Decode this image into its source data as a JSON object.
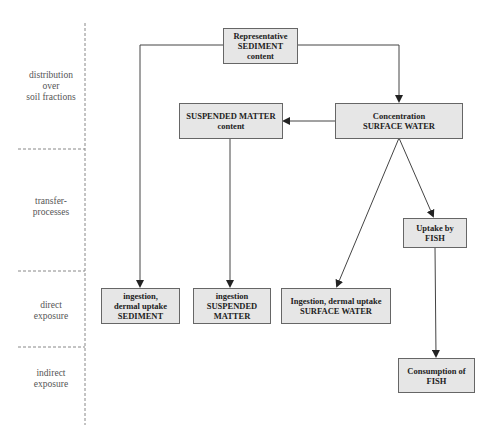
{
  "stages": [
    {
      "label": "distribution\nover\nsoil fractions"
    },
    {
      "label": "transfer-\nprocesses"
    },
    {
      "label": "direct\nexposure"
    },
    {
      "label": "indirect\nexposure"
    }
  ],
  "nodes": {
    "sediment": "Representative\nSEDIMENT\ncontent",
    "suspended": "SUSPENDED MATTER\ncontent",
    "surface_water": "Concentration\nSURFACE WATER",
    "uptake_fish": "Uptake by\nFISH",
    "ingest_sediment": "ingestion,\ndermal uptake\nSEDIMENT",
    "ingest_suspended": "ingestion\nSUSPENDED\nMATTER",
    "ingest_surface_water": "Ingestion, dermal uptake\nSURFACE WATER",
    "consumption_fish": "Consumption of\nFISH"
  },
  "colors": {
    "box_fill": "#e6e6e6",
    "box_border": "#666666",
    "line": "#444444",
    "divider": "#888888"
  }
}
